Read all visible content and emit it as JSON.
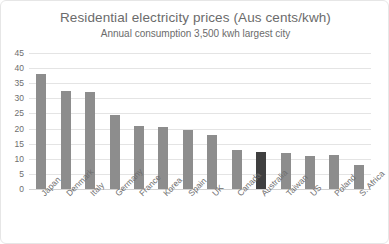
{
  "chart_data": {
    "type": "bar",
    "title": "Residential electricity prices (Aus cents/kwh)",
    "subtitle": "Annual consumption 3,500 kwh largest city",
    "xlabel": "",
    "ylabel": "",
    "ylim": [
      0,
      45
    ],
    "yticks": [
      0,
      5,
      10,
      15,
      20,
      25,
      30,
      35,
      40,
      45
    ],
    "grid": true,
    "legend": "none",
    "bar_color": "#8d8d8d",
    "highlight_color": "#3f3f3f",
    "highlight_category": "Australia",
    "categories": [
      "Japan",
      "Denmark",
      "Italy",
      "Germany",
      "France",
      "Korea",
      "Spain",
      "UK",
      "Canada",
      "Australia",
      "Taiwan",
      "US",
      "Poland",
      "S. Africa"
    ],
    "values": [
      38,
      32.5,
      32,
      24.5,
      21,
      20.5,
      19.5,
      18,
      13,
      12.2,
      11.8,
      10.8,
      11.2,
      8
    ]
  }
}
